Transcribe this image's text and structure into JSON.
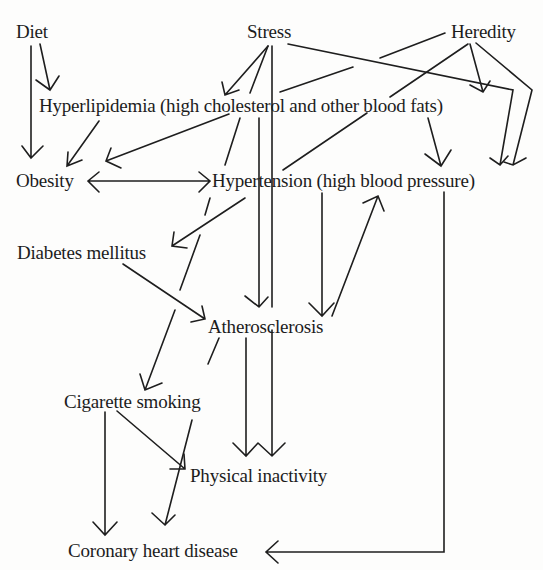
{
  "nodes": {
    "diet": "Diet",
    "stress": "Stress",
    "heredity": "Heredity",
    "hyperlipidemia": "Hyperlipidemia (high cholesterol and other blood fats)",
    "obesity": "Obesity",
    "hypertension": "Hypertension (high  blood pressure)",
    "diabetes": "Diabetes mellitus",
    "atherosclerosis": "Atherosclerosis",
    "smoking": "Cigarette smoking",
    "inactivity": "Physical inactivity",
    "chd": "Coronary heart disease"
  },
  "edges": [
    {
      "from": "diet",
      "to": "obesity"
    },
    {
      "from": "diet",
      "to": "hyperlipidemia"
    },
    {
      "from": "stress",
      "to": "hyperlipidemia"
    },
    {
      "from": "stress",
      "to": "hypertension"
    },
    {
      "from": "stress",
      "to": "atherosclerosis"
    },
    {
      "from": "stress",
      "to": "physical-inactivity"
    },
    {
      "from": "stress",
      "to": "cigarette-smoking"
    },
    {
      "from": "stress",
      "to": "hypertension"
    },
    {
      "from": "heredity",
      "to": "hyperlipidemia"
    },
    {
      "from": "heredity",
      "to": "obesity"
    },
    {
      "from": "heredity",
      "to": "diabetes"
    },
    {
      "from": "heredity",
      "to": "hypertension"
    },
    {
      "from": "hyperlipidemia",
      "to": "obesity"
    },
    {
      "from": "hyperlipidemia",
      "to": "hypertension"
    },
    {
      "from": "obesity",
      "to": "hypertension",
      "bidirectional": true
    },
    {
      "from": "hypertension",
      "to": "atherosclerosis"
    },
    {
      "from": "atherosclerosis",
      "to": "hypertension"
    },
    {
      "from": "hypertension",
      "to": "physical-inactivity"
    },
    {
      "from": "diabetes",
      "to": "atherosclerosis"
    },
    {
      "from": "atherosclerosis",
      "to": "coronary-heart-disease"
    },
    {
      "from": "smoking",
      "to": "coronary-heart-disease"
    },
    {
      "from": "smoking",
      "to": "physical-inactivity"
    },
    {
      "from": "hypertension",
      "to": "coronary-heart-disease"
    }
  ]
}
